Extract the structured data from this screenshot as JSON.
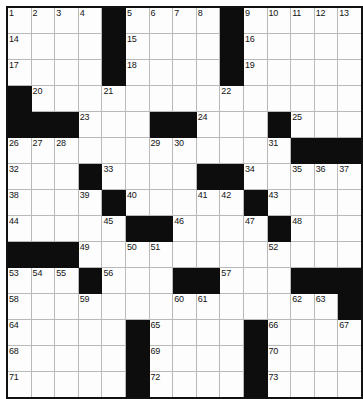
{
  "puzzle": {
    "title": "Crossword Grid",
    "rows": 14,
    "cols": 14,
    "cell_size_px": 25,
    "colors": {
      "block": "#0d0d0d",
      "cell": "#fdfdfd",
      "grid_line": "#b9b9b9",
      "border": "#111111",
      "number_text": "#141414"
    },
    "max_clue_number": 73,
    "grid": [
      [
        {
          "block": false,
          "number": "1"
        },
        {
          "block": false,
          "number": "2"
        },
        {
          "block": false,
          "number": "3"
        },
        {
          "block": false,
          "number": "4"
        },
        {
          "block": true,
          "number": ""
        },
        {
          "block": false,
          "number": "5"
        },
        {
          "block": false,
          "number": "6"
        },
        {
          "block": false,
          "number": "7"
        },
        {
          "block": false,
          "number": "8"
        },
        {
          "block": true,
          "number": ""
        },
        {
          "block": false,
          "number": "9"
        },
        {
          "block": false,
          "number": "10"
        },
        {
          "block": false,
          "number": "11"
        },
        {
          "block": false,
          "number": "12"
        },
        {
          "block": false,
          "number": "13"
        }
      ],
      [
        {
          "block": false,
          "number": "14"
        },
        {
          "block": false,
          "number": ""
        },
        {
          "block": false,
          "number": ""
        },
        {
          "block": false,
          "number": ""
        },
        {
          "block": true,
          "number": ""
        },
        {
          "block": false,
          "number": "15"
        },
        {
          "block": false,
          "number": ""
        },
        {
          "block": false,
          "number": ""
        },
        {
          "block": false,
          "number": ""
        },
        {
          "block": true,
          "number": ""
        },
        {
          "block": false,
          "number": "16"
        },
        {
          "block": false,
          "number": ""
        },
        {
          "block": false,
          "number": ""
        },
        {
          "block": false,
          "number": ""
        },
        {
          "block": false,
          "number": ""
        }
      ],
      [
        {
          "block": false,
          "number": "17"
        },
        {
          "block": false,
          "number": ""
        },
        {
          "block": false,
          "number": ""
        },
        {
          "block": false,
          "number": ""
        },
        {
          "block": true,
          "number": ""
        },
        {
          "block": false,
          "number": "18"
        },
        {
          "block": false,
          "number": ""
        },
        {
          "block": false,
          "number": ""
        },
        {
          "block": false,
          "number": ""
        },
        {
          "block": true,
          "number": ""
        },
        {
          "block": false,
          "number": "19"
        },
        {
          "block": false,
          "number": ""
        },
        {
          "block": false,
          "number": ""
        },
        {
          "block": false,
          "number": ""
        },
        {
          "block": false,
          "number": ""
        }
      ],
      [
        {
          "block": true,
          "number": ""
        },
        {
          "block": false,
          "number": "20"
        },
        {
          "block": false,
          "number": ""
        },
        {
          "block": false,
          "number": ""
        },
        {
          "block": false,
          "number": "21"
        },
        {
          "block": false,
          "number": ""
        },
        {
          "block": false,
          "number": ""
        },
        {
          "block": false,
          "number": ""
        },
        {
          "block": false,
          "number": ""
        },
        {
          "block": false,
          "number": "22"
        },
        {
          "block": false,
          "number": ""
        },
        {
          "block": false,
          "number": ""
        },
        {
          "block": false,
          "number": ""
        },
        {
          "block": false,
          "number": ""
        },
        {
          "block": false,
          "number": ""
        }
      ],
      [
        {
          "block": true,
          "number": ""
        },
        {
          "block": true,
          "number": ""
        },
        {
          "block": true,
          "number": ""
        },
        {
          "block": false,
          "number": "23"
        },
        {
          "block": false,
          "number": ""
        },
        {
          "block": false,
          "number": ""
        },
        {
          "block": true,
          "number": ""
        },
        {
          "block": true,
          "number": ""
        },
        {
          "block": false,
          "number": "24"
        },
        {
          "block": false,
          "number": ""
        },
        {
          "block": false,
          "number": ""
        },
        {
          "block": true,
          "number": ""
        },
        {
          "block": false,
          "number": "25"
        },
        {
          "block": false,
          "number": ""
        },
        {
          "block": false,
          "number": ""
        }
      ],
      [
        {
          "block": false,
          "number": "26"
        },
        {
          "block": false,
          "number": "27"
        },
        {
          "block": false,
          "number": "28"
        },
        {
          "block": false,
          "number": ""
        },
        {
          "block": false,
          "number": ""
        },
        {
          "block": false,
          "number": ""
        },
        {
          "block": false,
          "number": "29"
        },
        {
          "block": false,
          "number": "30"
        },
        {
          "block": false,
          "number": ""
        },
        {
          "block": false,
          "number": ""
        },
        {
          "block": false,
          "number": ""
        },
        {
          "block": false,
          "number": "31"
        },
        {
          "block": true,
          "number": ""
        },
        {
          "block": true,
          "number": ""
        },
        {
          "block": true,
          "number": ""
        }
      ],
      [
        {
          "block": false,
          "number": "32"
        },
        {
          "block": false,
          "number": ""
        },
        {
          "block": false,
          "number": ""
        },
        {
          "block": true,
          "number": ""
        },
        {
          "block": false,
          "number": "33"
        },
        {
          "block": false,
          "number": ""
        },
        {
          "block": false,
          "number": ""
        },
        {
          "block": false,
          "number": ""
        },
        {
          "block": true,
          "number": ""
        },
        {
          "block": true,
          "number": ""
        },
        {
          "block": false,
          "number": "34"
        },
        {
          "block": false,
          "number": ""
        },
        {
          "block": false,
          "number": "35"
        },
        {
          "block": false,
          "number": "36"
        },
        {
          "block": false,
          "number": "37"
        }
      ],
      [
        {
          "block": false,
          "number": "38"
        },
        {
          "block": false,
          "number": ""
        },
        {
          "block": false,
          "number": ""
        },
        {
          "block": false,
          "number": "39"
        },
        {
          "block": true,
          "number": ""
        },
        {
          "block": false,
          "number": "40"
        },
        {
          "block": false,
          "number": ""
        },
        {
          "block": false,
          "number": ""
        },
        {
          "block": false,
          "number": "41"
        },
        {
          "block": false,
          "number": "42"
        },
        {
          "block": true,
          "number": ""
        },
        {
          "block": false,
          "number": "43"
        },
        {
          "block": false,
          "number": ""
        },
        {
          "block": false,
          "number": ""
        },
        {
          "block": false,
          "number": ""
        }
      ],
      [
        {
          "block": false,
          "number": "44"
        },
        {
          "block": false,
          "number": ""
        },
        {
          "block": false,
          "number": ""
        },
        {
          "block": false,
          "number": ""
        },
        {
          "block": false,
          "number": "45"
        },
        {
          "block": true,
          "number": ""
        },
        {
          "block": true,
          "number": ""
        },
        {
          "block": false,
          "number": "46"
        },
        {
          "block": false,
          "number": ""
        },
        {
          "block": false,
          "number": ""
        },
        {
          "block": false,
          "number": "47"
        },
        {
          "block": true,
          "number": ""
        },
        {
          "block": false,
          "number": "48"
        },
        {
          "block": false,
          "number": ""
        },
        {
          "block": false,
          "number": ""
        }
      ],
      [
        {
          "block": true,
          "number": ""
        },
        {
          "block": true,
          "number": ""
        },
        {
          "block": true,
          "number": ""
        },
        {
          "block": false,
          "number": "49"
        },
        {
          "block": false,
          "number": ""
        },
        {
          "block": false,
          "number": "50"
        },
        {
          "block": false,
          "number": "51"
        },
        {
          "block": false,
          "number": ""
        },
        {
          "block": false,
          "number": ""
        },
        {
          "block": false,
          "number": ""
        },
        {
          "block": false,
          "number": ""
        },
        {
          "block": false,
          "number": "52"
        },
        {
          "block": false,
          "number": ""
        },
        {
          "block": false,
          "number": ""
        },
        {
          "block": false,
          "number": ""
        }
      ],
      [
        {
          "block": false,
          "number": "53"
        },
        {
          "block": false,
          "number": "54"
        },
        {
          "block": false,
          "number": "55"
        },
        {
          "block": true,
          "number": ""
        },
        {
          "block": false,
          "number": "56"
        },
        {
          "block": false,
          "number": ""
        },
        {
          "block": false,
          "number": ""
        },
        {
          "block": true,
          "number": ""
        },
        {
          "block": true,
          "number": ""
        },
        {
          "block": false,
          "number": "57"
        },
        {
          "block": false,
          "number": ""
        },
        {
          "block": false,
          "number": ""
        },
        {
          "block": true,
          "number": ""
        },
        {
          "block": true,
          "number": ""
        },
        {
          "block": true,
          "number": ""
        }
      ],
      [
        {
          "block": false,
          "number": "58"
        },
        {
          "block": false,
          "number": ""
        },
        {
          "block": false,
          "number": ""
        },
        {
          "block": false,
          "number": "59"
        },
        {
          "block": false,
          "number": ""
        },
        {
          "block": false,
          "number": ""
        },
        {
          "block": false,
          "number": ""
        },
        {
          "block": false,
          "number": "60"
        },
        {
          "block": false,
          "number": "61"
        },
        {
          "block": false,
          "number": ""
        },
        {
          "block": false,
          "number": ""
        },
        {
          "block": false,
          "number": ""
        },
        {
          "block": false,
          "number": "62"
        },
        {
          "block": false,
          "number": "63"
        },
        {
          "block": true,
          "number": ""
        }
      ],
      [
        {
          "block": false,
          "number": "64"
        },
        {
          "block": false,
          "number": ""
        },
        {
          "block": false,
          "number": ""
        },
        {
          "block": false,
          "number": ""
        },
        {
          "block": false,
          "number": ""
        },
        {
          "block": true,
          "number": ""
        },
        {
          "block": false,
          "number": "65"
        },
        {
          "block": false,
          "number": ""
        },
        {
          "block": false,
          "number": ""
        },
        {
          "block": false,
          "number": ""
        },
        {
          "block": true,
          "number": ""
        },
        {
          "block": false,
          "number": "66"
        },
        {
          "block": false,
          "number": ""
        },
        {
          "block": false,
          "number": ""
        },
        {
          "block": false,
          "number": "67"
        }
      ],
      [
        {
          "block": false,
          "number": "68"
        },
        {
          "block": false,
          "number": ""
        },
        {
          "block": false,
          "number": ""
        },
        {
          "block": false,
          "number": ""
        },
        {
          "block": false,
          "number": ""
        },
        {
          "block": true,
          "number": ""
        },
        {
          "block": false,
          "number": "69"
        },
        {
          "block": false,
          "number": ""
        },
        {
          "block": false,
          "number": ""
        },
        {
          "block": false,
          "number": ""
        },
        {
          "block": true,
          "number": ""
        },
        {
          "block": false,
          "number": "70"
        },
        {
          "block": false,
          "number": ""
        },
        {
          "block": false,
          "number": ""
        },
        {
          "block": false,
          "number": ""
        }
      ],
      [
        {
          "block": false,
          "number": "71"
        },
        {
          "block": false,
          "number": ""
        },
        {
          "block": false,
          "number": ""
        },
        {
          "block": false,
          "number": ""
        },
        {
          "block": false,
          "number": ""
        },
        {
          "block": true,
          "number": ""
        },
        {
          "block": false,
          "number": "72"
        },
        {
          "block": false,
          "number": ""
        },
        {
          "block": false,
          "number": ""
        },
        {
          "block": false,
          "number": ""
        },
        {
          "block": true,
          "number": ""
        },
        {
          "block": false,
          "number": "73"
        },
        {
          "block": false,
          "number": ""
        },
        {
          "block": false,
          "number": ""
        },
        {
          "block": false,
          "number": ""
        }
      ]
    ]
  }
}
